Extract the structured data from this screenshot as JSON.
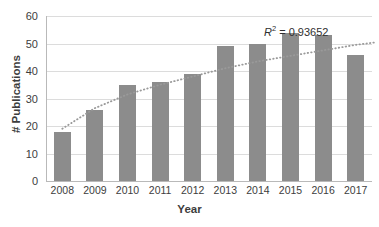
{
  "chart_data": {
    "type": "bar",
    "title": "",
    "subtitle": "",
    "xlabel": "Year",
    "ylabel": "# Publications",
    "categories": [
      "2008",
      "2009",
      "2010",
      "2011",
      "2012",
      "2013",
      "2014",
      "2015",
      "2016",
      "2017"
    ],
    "values": [
      18,
      26,
      35,
      36,
      39,
      49,
      50,
      54,
      53,
      46
    ],
    "series": [
      {
        "name": "# Publications",
        "values": [
          18,
          26,
          35,
          36,
          39,
          49,
          50,
          54,
          53,
          46
        ]
      }
    ],
    "ylim": [
      0,
      60
    ],
    "yticks": [
      0,
      10,
      20,
      30,
      40,
      50,
      60
    ],
    "ytick_labels": [
      "0",
      "10",
      "20",
      "30",
      "40",
      "50",
      "60"
    ],
    "xtick_labels": [
      "2008",
      "2009",
      "2010",
      "2011",
      "2012",
      "2013",
      "2014",
      "2015",
      "2016",
      "2017"
    ],
    "grid": true,
    "grid_axis": "y",
    "legend": false,
    "legend_position": "none",
    "bar_color": "#8c8c8c",
    "grid_color": "#dcdcdc",
    "axis_color": "#b9b9b9",
    "background": "#ffffff",
    "trendline": {
      "type": "logarithmic",
      "style": "dotted",
      "color": "#9a9a9a",
      "r_squared": 0.93652,
      "points": [
        {
          "x": 0.0,
          "y": 19.0
        },
        {
          "x": 1.0,
          "y": 26.5
        },
        {
          "x": 2.0,
          "y": 31.5
        },
        {
          "x": 3.0,
          "y": 35.0
        },
        {
          "x": 4.0,
          "y": 38.0
        },
        {
          "x": 5.0,
          "y": 41.0
        },
        {
          "x": 6.0,
          "y": 43.5
        },
        {
          "x": 7.0,
          "y": 45.5
        },
        {
          "x": 8.0,
          "y": 47.5
        },
        {
          "x": 9.0,
          "y": 49.5
        },
        {
          "x": 10.0,
          "y": 51.0
        }
      ]
    },
    "annotation": {
      "r2_prefix": "R",
      "r2_sup": "2",
      "r2_value": " = 0.93652"
    }
  }
}
